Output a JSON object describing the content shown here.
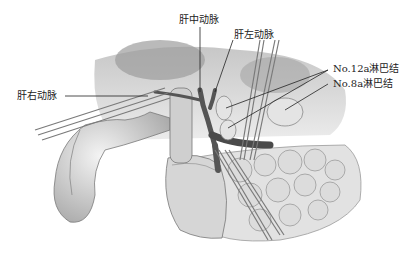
{
  "figure": {
    "type": "surgical-anatomy-illustration",
    "style": "grayscale",
    "labels": {
      "middle_hepatic_artery": "肝中动脉",
      "left_hepatic_artery": "肝左动脉",
      "right_hepatic_artery": "肝右动脉",
      "lymph_node_12a": "No.12a淋巴结",
      "lymph_node_8a": "No.8a淋巴结"
    }
  }
}
